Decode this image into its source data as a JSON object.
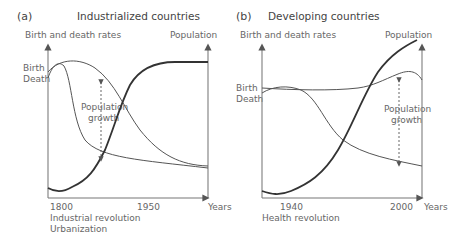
{
  "panels": [
    {
      "letter": "(a)",
      "title": "Industrialized countries",
      "left_axis_label": "Birth and death rates",
      "right_axis_label": "Population",
      "birth_label": "Birth",
      "death_label": "Death",
      "growth_label_1": "Population",
      "growth_label_2": "growth",
      "x_axis_label": "Years",
      "ticks": [
        "1800",
        "1950"
      ],
      "caption_1": "Industrial revolution",
      "caption_2": "Urbanization"
    },
    {
      "letter": "(b)",
      "title": "Developing countries",
      "left_axis_label": "Birth and death rates",
      "right_axis_label": "Population",
      "birth_label": "Birth",
      "death_label": "Death",
      "growth_label_1": "Population",
      "growth_label_2": "growth",
      "x_axis_label": "Years",
      "ticks": [
        "1940",
        "2000"
      ],
      "caption_1": "Health revolution"
    }
  ],
  "colors": {
    "axis": "#777777",
    "curve": "#555555",
    "population_curve": "#333333",
    "text": "#666666"
  }
}
